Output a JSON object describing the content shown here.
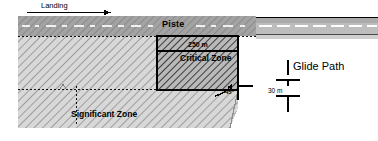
{
  "diagram": {
    "labels": {
      "landing": "Landing",
      "piste": "Piste",
      "critical_zone_distance": "250 m",
      "critical_zone": "Critical Zone",
      "significant_zone": "Significant Zone",
      "glide_path": "Glide Path",
      "clearance_height": "30 m",
      "slope_angle": "45°"
    },
    "colors": {
      "background": "#ffffff",
      "piste_band": "#9a9a9a",
      "road_band": "#b4b4b4",
      "significant_fill": "#d2d2d2",
      "critical_fill": "#a8a8a8",
      "outline": "#000000",
      "hatch": "#6e6e6e",
      "dash": "#1a1a1a"
    },
    "elements": {
      "landing_arrow": "arrow-right-icon",
      "dimension_marker": "dimension-arrow-icon",
      "angle_arc": "angle-arc-icon",
      "centerline": "dashed-centerline"
    }
  }
}
